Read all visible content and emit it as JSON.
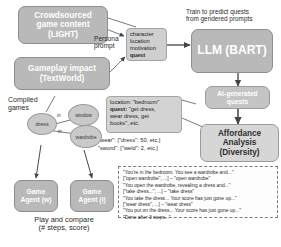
{
  "diagram": {
    "nodes": {
      "crowdsourced": "Crowdsourced\ngame content\n(LIGHT)",
      "gameplay": "Gameplay impact\n(TextWorld)",
      "llm": "LLM (BART)",
      "affordance": "Affordance\nAnalysis\n(Diversity)",
      "ai_quests": "AI-generated\nquests",
      "agent_w": "Game\nAgent (w)",
      "agent_i": "Game\nAgent (i)"
    },
    "labels": {
      "train": "Train to predict quests\nfrom gendered prompts",
      "persona_prompt": "Persona\nprompt",
      "compiled_games": "Compiled\ngames",
      "play_compare": "Play and compare\n(# steps, score)"
    },
    "callouts": {
      "fields": [
        "character",
        "location",
        "motivation",
        "quest"
      ],
      "fields_bold_index": 3,
      "quest_spec": [
        {
          "key": "location: ",
          "val": "\"bedroom\"",
          "bold": false
        },
        {
          "key": "quest: ",
          "val": "\"get dress,",
          "bold": true
        },
        {
          "key": "",
          "val": "wear dress, get",
          "bold": false
        },
        {
          "key": "",
          "val": "books\", etc.",
          "bold": false
        }
      ],
      "affordances": [
        "\"wear\": [\"dress\": 50, etc.]",
        "\"sword\": [\"weld\": 2, etc.]"
      ]
    },
    "transcript": [
      "\"You're in the bedroom. You see a wardrobe and...\"",
      "[\"open wardrobe\", ...] – \"open wardrobe\"",
      "\"You open the wardrobe, revealing a dress and...\"",
      "[\"take dress...\", ...] – \"take dress\"",
      "\"You take the dress... Your score has just gone up...\"",
      "[\"wear dress\", ...] – \"wear dress\"",
      "\"You put on the dress... Your score has just gone up...\"",
      "\"Done after 3 steps...\""
    ],
    "graph": {
      "nodes": [
        {
          "label": "dress"
        },
        {
          "label": "window"
        },
        {
          "label": "wardrobe"
        }
      ],
      "edges": [
        {
          "label": "in"
        },
        {
          "label": "in"
        }
      ]
    },
    "colors": {
      "box_fill": "#b9b9b9",
      "callout_fill": "#cfcfcf",
      "node_fill": "#c9c9c9",
      "wire": "#5a5a5a",
      "text": "#2b2b2b"
    }
  }
}
